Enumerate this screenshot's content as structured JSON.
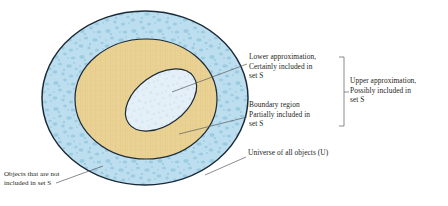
{
  "figure": {
    "regions": [
      {
        "id": "universe",
        "name": "Universe of all objects (U)",
        "fill": "#b9dcec",
        "stroke": "#1b2a38",
        "texture": "mottled-blue-stipple"
      },
      {
        "id": "boundary",
        "name": "Boundary region",
        "fill": "#e9d293",
        "stroke": "#1b2a38",
        "texture": "fine-crosshatch-tan"
      },
      {
        "id": "lower",
        "name": "Lower approximation",
        "fill": "#e2eef6",
        "stroke": "#1b2a38",
        "texture": "pale-speckle"
      }
    ],
    "annotations": {
      "lower_approximation": "Lower approximation,\nCertainly included in\nset S",
      "boundary_region": "Boundary region\nPartially included in\nset S",
      "universe": "Universe of all objects (U)",
      "upper_approximation": "Upper approximation,\nPossibly included in\nset S",
      "objects_outside": "Objects that are not\nincluded in set S"
    },
    "colors": {
      "outer_ring": "#b9dcec",
      "middle_ring": "#e9d293",
      "inner_ellipse": "#e2eef6",
      "outline": "#1b2a38",
      "leader_line": "#4a4a52",
      "text": "#231f20",
      "background": "#ffffff"
    }
  }
}
